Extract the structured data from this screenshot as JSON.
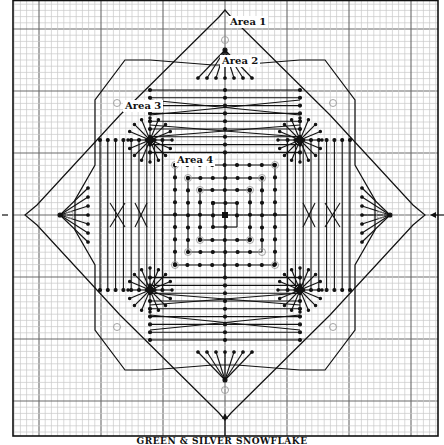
{
  "diagram": {
    "type": "needlepoint-stitch-chart",
    "caption": "GREEN & SILVER SNOWFLAKE",
    "grid": {
      "left": 13,
      "top": 0,
      "right": 438,
      "bottom": 436,
      "fine_step": 6.2,
      "heavy_every": 10
    },
    "center": {
      "x": 225,
      "y": 215
    },
    "area_labels": [
      {
        "id": "area-1",
        "text": "Area 1",
        "x": 230,
        "y": 25
      },
      {
        "id": "area-2",
        "text": "Area 2",
        "x": 222,
        "y": 64
      },
      {
        "id": "area-3",
        "text": "Area 3",
        "x": 125,
        "y": 109
      },
      {
        "id": "area-4",
        "text": "Area 4",
        "x": 177,
        "y": 163
      }
    ],
    "colors": {
      "grid_fine": "#c8c8c8",
      "grid_heavy": "#6a6a6a",
      "stitch": "#111111",
      "bead_marker": "#9a9a9a",
      "background": "#ffffff"
    }
  }
}
